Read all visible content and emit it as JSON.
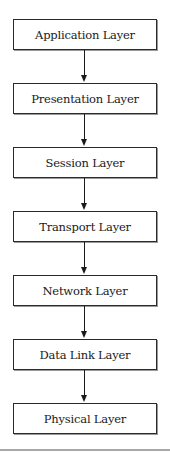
{
  "diagram": {
    "type": "flowchart",
    "title": "",
    "layers": [
      {
        "label": "Application Layer"
      },
      {
        "label": "Presentation Layer"
      },
      {
        "label": "Session Layer"
      },
      {
        "label": "Transport Layer"
      },
      {
        "label": "Network Layer"
      },
      {
        "label": "Data Link Layer"
      },
      {
        "label": "Physical Layer"
      }
    ],
    "edges": [
      {
        "from": "Application Layer",
        "to": "Presentation Layer"
      },
      {
        "from": "Presentation Layer",
        "to": "Session Layer"
      },
      {
        "from": "Session Layer",
        "to": "Transport Layer"
      },
      {
        "from": "Transport Layer",
        "to": "Network Layer"
      },
      {
        "from": "Network Layer",
        "to": "Data Link Layer"
      },
      {
        "from": "Data Link Layer",
        "to": "Physical Layer"
      }
    ],
    "colors": {
      "border": "#2a2a2a",
      "shadow": "#9a9a9a",
      "rule": "#a8a8a8"
    }
  }
}
